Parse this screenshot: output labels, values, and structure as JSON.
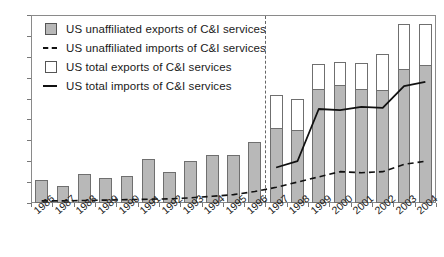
{
  "chart_data": {
    "type": "bar",
    "title": "",
    "subtitle": "",
    "xlabel": "",
    "ylabel": "",
    "ylim": [
      0,
      9
    ],
    "ytick_step": 1,
    "yticks": [
      "0",
      "1",
      "2",
      "3",
      "4",
      "5",
      "6",
      "7",
      "8",
      "9"
    ],
    "grid": false,
    "legend_position": "upper-left-inside",
    "categories": [
      "1986",
      "1987",
      "1988",
      "1989",
      "1990",
      "1991",
      "1992",
      "1993",
      "1994",
      "1995",
      "1996",
      "1997",
      "1998",
      "1999",
      "2000",
      "2001",
      "2002",
      "2003",
      "2004"
    ],
    "series": [
      {
        "name": "US unaffiliated exports of C&I services",
        "kind": "bar-segment",
        "color": "#b8b8b8",
        "values": [
          1.1,
          0.8,
          1.4,
          1.2,
          1.3,
          2.1,
          1.5,
          2.0,
          2.3,
          2.3,
          2.9,
          3.6,
          3.5,
          5.45,
          5.65,
          5.45,
          5.4,
          6.4,
          6.6
        ]
      },
      {
        "name": "US total exports of C&I services",
        "kind": "bar-total",
        "color": "#ffffff",
        "values": [
          null,
          null,
          null,
          null,
          null,
          null,
          null,
          null,
          null,
          null,
          null,
          5.15,
          5.0,
          6.65,
          6.75,
          6.7,
          7.15,
          8.55,
          8.55
        ]
      },
      {
        "name": "US unaffiliated imports of C&I services",
        "kind": "line-dashed",
        "color": "#111111",
        "values": [
          0.1,
          0.1,
          0.12,
          0.14,
          0.16,
          0.18,
          0.2,
          0.25,
          0.32,
          0.4,
          0.55,
          0.75,
          1.0,
          1.25,
          1.5,
          1.45,
          1.5,
          1.85,
          2.0
        ]
      },
      {
        "name": "US total imports of C&I services",
        "kind": "line-solid",
        "color": "#111111",
        "values": [
          null,
          null,
          null,
          null,
          null,
          null,
          null,
          null,
          null,
          null,
          null,
          1.7,
          2.0,
          4.5,
          4.45,
          4.6,
          4.55,
          5.6,
          5.8
        ]
      }
    ]
  },
  "legend": {
    "items": [
      {
        "label": "US unaffiliated exports of C&I services",
        "key": "swatch-gray"
      },
      {
        "label": "US unaffiliated imports of C&I services",
        "key": "dashed-line"
      },
      {
        "label": "US total exports of C&I services",
        "key": "swatch-white"
      },
      {
        "label": "US total imports of C&I services",
        "key": "solid-line"
      }
    ]
  },
  "annotations": {
    "divider": {
      "name": "period-divider",
      "between": [
        "1996",
        "1997"
      ],
      "style": "vertical-dashed"
    }
  }
}
